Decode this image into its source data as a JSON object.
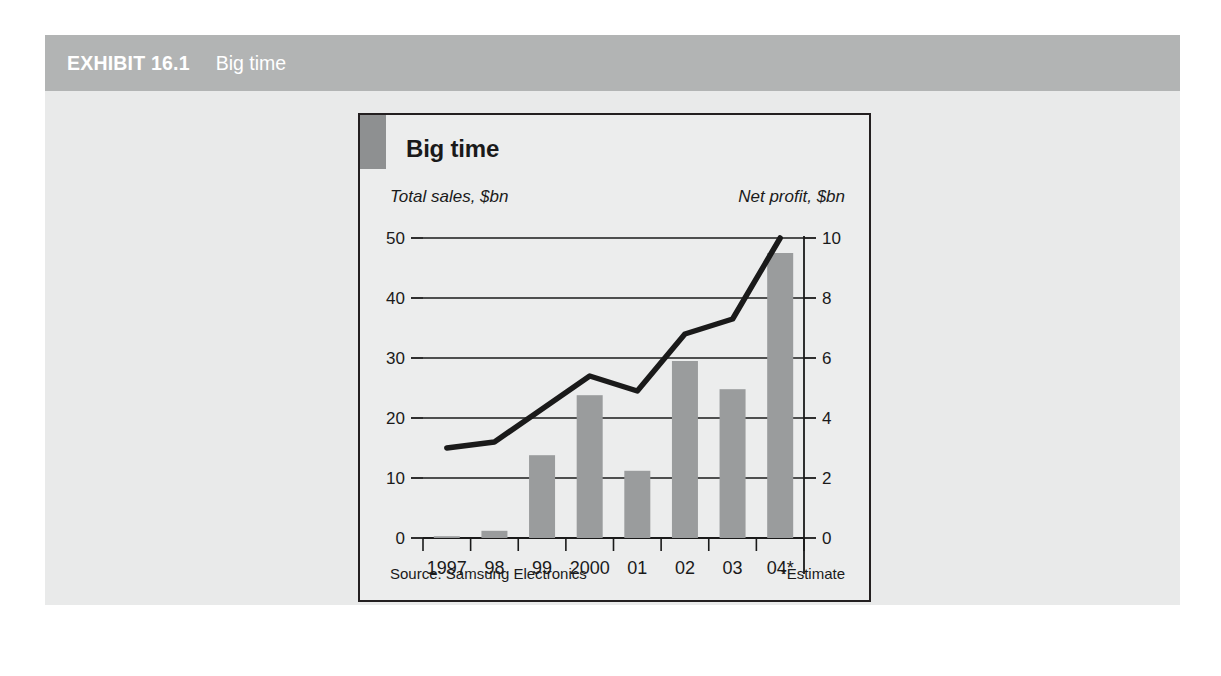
{
  "exhibit": {
    "label": "EXHIBIT 16.1",
    "title": "Big time",
    "header_bg": "#b2b4b4",
    "panel_bg": "#e9eaea"
  },
  "chart": {
    "title": "Big time",
    "left_axis_label": "Total sales, $bn",
    "right_axis_label": "Net profit, $bn",
    "source": "Source: Samsung Electronics",
    "footnote": "*Estimate",
    "bar_color": "#9a9c9d",
    "line_color": "#1a1a1a",
    "marker_color": "#8e9091",
    "card_bg": "#eceded",
    "border_color": "#231f20"
  },
  "chart_data": {
    "type": "bar",
    "title": "Big time",
    "xlabel": "",
    "ylabel": "Total sales, $bn",
    "y2label": "Net profit, $bn",
    "categories": [
      "1997",
      "98",
      "99",
      "2000",
      "01",
      "02",
      "03",
      "04*"
    ],
    "ylim": [
      0,
      50
    ],
    "yticks": [
      0,
      10,
      20,
      30,
      40,
      50
    ],
    "y2lim": [
      0,
      10
    ],
    "y2ticks": [
      0,
      2,
      4,
      6,
      8,
      10
    ],
    "grid": true,
    "legend": "none",
    "series": [
      {
        "name": "Total sales, $bn",
        "type": "bar",
        "axis": "left",
        "values": [
          0.3,
          1.2,
          13.8,
          23.8,
          11.2,
          29.5,
          24.8,
          47.5
        ]
      },
      {
        "name": "Net profit, $bn",
        "type": "line",
        "axis": "right",
        "values": [
          3.0,
          3.2,
          4.3,
          5.4,
          4.9,
          6.8,
          7.3,
          10.0
        ]
      }
    ],
    "annotations": [
      "Source: Samsung Electronics",
      "*Estimate"
    ]
  }
}
